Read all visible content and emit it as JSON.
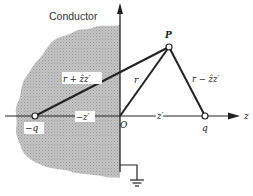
{
  "figure": {
    "title_label": "Conductor",
    "labels": {
      "point_p": "P",
      "origin": "O",
      "charge_pos": "q",
      "charge_neg": "−q",
      "z_axis": "z",
      "dist_pos": "z′",
      "dist_neg": "−z′",
      "vec_r": "r",
      "vec_r_minus": "r − ẑz′",
      "vec_r_plus": "r + ẑz′"
    },
    "colors": {
      "line": "#222222",
      "conductor_fill": "#b8b8b8",
      "background": "#ffffff"
    }
  }
}
